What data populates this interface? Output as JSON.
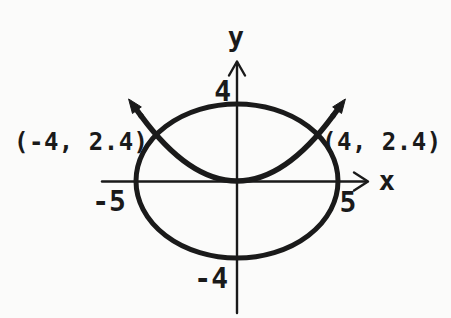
{
  "figure": {
    "axes": {
      "x_label": "x",
      "y_label": "y"
    },
    "ticks": {
      "y_pos": "4",
      "y_neg": "-4",
      "x_neg": "-5",
      "x_pos": "5"
    },
    "point_labels": {
      "left": "(-4, 2.4)",
      "right": "(4, 2.4)"
    },
    "colors": {
      "ink": "#1a1a1a",
      "background": "#fbfbfa"
    }
  },
  "chart_data": {
    "type": "line",
    "title": "",
    "xlabel": "x",
    "ylabel": "y",
    "xlim": [
      -6.6,
      6.6
    ],
    "ylim": [
      -6.9,
      6.3
    ],
    "grid": false,
    "tick_labels": {
      "x": [
        "-5",
        "5"
      ],
      "y": [
        "4",
        "-4"
      ]
    },
    "series": [
      {
        "name": "ellipse",
        "equation": "x^2/25 + y^2/16 = 1",
        "center": [
          0,
          0
        ],
        "x_intercepts": [
          -5,
          5
        ],
        "y_intercepts": [
          -4,
          4
        ]
      },
      {
        "name": "parabola",
        "equation": "y = 0.15x^2",
        "vertex": [
          0,
          0
        ],
        "opens": "up",
        "arrows": "both-ends",
        "draw_extent_x": 4.75,
        "points": [
          [
            -4,
            2.4
          ],
          [
            0,
            0
          ],
          [
            4,
            2.4
          ]
        ]
      }
    ],
    "annotations": [
      {
        "text": "(-4, 2.4)",
        "point": [
          -4,
          2.4
        ],
        "side": "left"
      },
      {
        "text": "(4, 2.4)",
        "point": [
          4,
          2.4
        ],
        "side": "right"
      }
    ]
  }
}
